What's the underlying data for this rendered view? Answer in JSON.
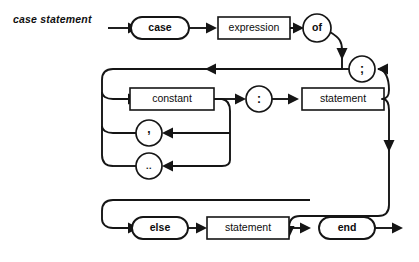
{
  "page": {
    "title": "case statement",
    "background_color": "#ffffff",
    "line_color": "#151515",
    "caption": ""
  },
  "diagram": {
    "type": "railroad-syntax-diagram",
    "name": "case statement",
    "nodes": [
      {
        "id": "case",
        "label": "case",
        "kind": "terminal",
        "shape": "stadium",
        "x": 160,
        "y": 28,
        "w": 58,
        "h": 22
      },
      {
        "id": "expression",
        "label": "expression",
        "kind": "nonterminal",
        "shape": "rect",
        "x": 254,
        "y": 28,
        "w": 72,
        "h": 22
      },
      {
        "id": "of",
        "label": "of",
        "kind": "terminal",
        "shape": "circle",
        "x": 317,
        "y": 28,
        "w": 30,
        "h": 26
      },
      {
        "id": "semicolon",
        "label": ";",
        "kind": "punctuation",
        "shape": "circle",
        "x": 362,
        "y": 69,
        "w": 26,
        "h": 26
      },
      {
        "id": "constant",
        "label": "constant",
        "kind": "nonterminal",
        "shape": "rect",
        "x": 172,
        "y": 99,
        "w": 84,
        "h": 22
      },
      {
        "id": "colon",
        "label": ":",
        "kind": "punctuation",
        "shape": "circle",
        "x": 259,
        "y": 99,
        "w": 26,
        "h": 26
      },
      {
        "id": "statement1",
        "label": "statement",
        "kind": "nonterminal",
        "shape": "rect",
        "x": 343,
        "y": 99,
        "w": 82,
        "h": 22
      },
      {
        "id": "comma",
        "label": ",",
        "kind": "punctuation",
        "shape": "circle",
        "x": 149,
        "y": 133,
        "w": 26,
        "h": 26
      },
      {
        "id": "range",
        "label": "..",
        "kind": "punctuation",
        "shape": "circle",
        "x": 149,
        "y": 166,
        "w": 26,
        "h": 26
      },
      {
        "id": "else",
        "label": "else",
        "kind": "terminal",
        "shape": "stadium",
        "x": 160,
        "y": 228,
        "w": 56,
        "h": 22
      },
      {
        "id": "statement2",
        "label": "statement",
        "kind": "nonterminal",
        "shape": "rect",
        "x": 248,
        "y": 228,
        "w": 82,
        "h": 22
      },
      {
        "id": "end",
        "label": "end",
        "kind": "terminal",
        "shape": "stadium",
        "x": 347,
        "y": 228,
        "w": 56,
        "h": 22
      }
    ],
    "labels": {
      "case": "case",
      "expression": "expression",
      "of": "of",
      "semicolon": ";",
      "constant": "constant",
      "colon": ":",
      "statement_1": "statement",
      "comma": ",",
      "range": "..",
      "else": "else",
      "statement_2": "statement",
      "end": "end"
    }
  }
}
